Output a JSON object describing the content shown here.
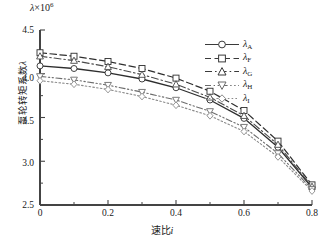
{
  "axes": {
    "y_top_annotation_lambda": "λ",
    "y_top_annotation_mult": "×10",
    "y_top_annotation_exp": "6",
    "ylabel_cn": "泵轮转矩系数",
    "ylabel_symbol": "λ",
    "xlabel_cn": "速比",
    "xlabel_symbol": "i",
    "yticks": [
      "2.5",
      "3.0",
      "3.5",
      "4.0",
      "4.5"
    ],
    "xticks": [
      "0",
      "0.2",
      "0.4",
      "0.6",
      "0.8"
    ]
  },
  "legend": {
    "items": [
      {
        "label": "λ",
        "sub": "A",
        "marker": "circle",
        "line": "solid"
      },
      {
        "label": "λ",
        "sub": "F",
        "marker": "square",
        "line": "dashed"
      },
      {
        "label": "λ",
        "sub": "G",
        "marker": "triangle-up",
        "line": "dash-dot"
      },
      {
        "label": "λ",
        "sub": "H",
        "marker": "triangle-down",
        "line": "dash-dot-dot"
      },
      {
        "label": "λ",
        "sub": "I",
        "marker": "diamond",
        "line": "dotted"
      }
    ]
  },
  "chart_data": {
    "type": "line",
    "title": "",
    "xlabel": "速比 i",
    "ylabel": "泵轮转矩系数λ",
    "y_axis_multiplier": "×10^6",
    "xlim": [
      0,
      0.8
    ],
    "ylim": [
      2.5,
      4.5
    ],
    "grid": false,
    "legend_position": "upper-right-inside",
    "x": [
      0,
      0.1,
      0.2,
      0.3,
      0.4,
      0.5,
      0.6,
      0.7,
      0.8
    ],
    "series": [
      {
        "name": "λA",
        "marker": "circle",
        "line": "solid",
        "values": [
          4.09,
          4.06,
          4.01,
          3.94,
          3.84,
          3.7,
          3.49,
          3.16,
          2.7
        ]
      },
      {
        "name": "λF",
        "marker": "square",
        "line": "dashed",
        "values": [
          4.24,
          4.2,
          4.14,
          4.06,
          3.95,
          3.8,
          3.58,
          3.23,
          2.73
        ]
      },
      {
        "name": "λG",
        "marker": "triangle-up",
        "line": "dash-dot",
        "values": [
          4.2,
          4.15,
          4.08,
          3.99,
          3.88,
          3.73,
          3.52,
          3.19,
          2.71
        ]
      },
      {
        "name": "λH",
        "marker": "triangle-down",
        "line": "dash-dot-dot",
        "values": [
          3.97,
          3.93,
          3.87,
          3.79,
          3.7,
          3.57,
          3.39,
          3.09,
          2.68
        ]
      },
      {
        "name": "λI",
        "marker": "diamond",
        "line": "dotted",
        "values": [
          3.92,
          3.88,
          3.82,
          3.74,
          3.64,
          3.52,
          3.34,
          3.05,
          2.66
        ]
      }
    ]
  }
}
